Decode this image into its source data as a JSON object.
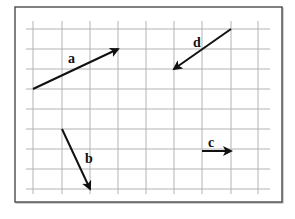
{
  "figure": {
    "title": "",
    "width": 295,
    "height": 219,
    "frame": {
      "x": 15,
      "y": 7,
      "width": 267,
      "height": 195
    },
    "grid": {
      "vertical_x": [
        33,
        62,
        90,
        118,
        146,
        174,
        202,
        231,
        258
      ],
      "horizontal_y": [
        29,
        49,
        69,
        89,
        109,
        129,
        149,
        169,
        189
      ],
      "extent": {
        "x1": 26,
        "x2": 270,
        "y1": 21,
        "y2": 194
      },
      "cell_width": 28,
      "cell_height": 20,
      "color": "#b3b3b3"
    },
    "vectors": [
      {
        "id": "a",
        "label": "a",
        "from": [
          33,
          89
        ],
        "to": [
          118,
          49
        ],
        "grid_components": {
          "dx": 3,
          "dy": 2
        },
        "label_pos": [
          68,
          63
        ]
      },
      {
        "id": "b",
        "label": "b",
        "from": [
          62,
          129
        ],
        "to": [
          90,
          189
        ],
        "grid_components": {
          "dx": 1,
          "dy": -3
        },
        "label_pos": [
          85,
          163
        ]
      },
      {
        "id": "c",
        "label": "c",
        "from": [
          202,
          151
        ],
        "to": [
          231,
          151
        ],
        "grid_components": {
          "dx": 1,
          "dy": 0
        },
        "label_pos": [
          208,
          147
        ]
      },
      {
        "id": "d",
        "label": "d",
        "from": [
          231,
          29
        ],
        "to": [
          174,
          69
        ],
        "grid_components": {
          "dx": -2,
          "dy": -2
        },
        "label_pos": [
          193,
          47
        ]
      }
    ],
    "colors": {
      "vector": "#111111",
      "grid": "#b3b3b3",
      "frame": "#4a4a4a",
      "background": "#ffffff"
    }
  }
}
